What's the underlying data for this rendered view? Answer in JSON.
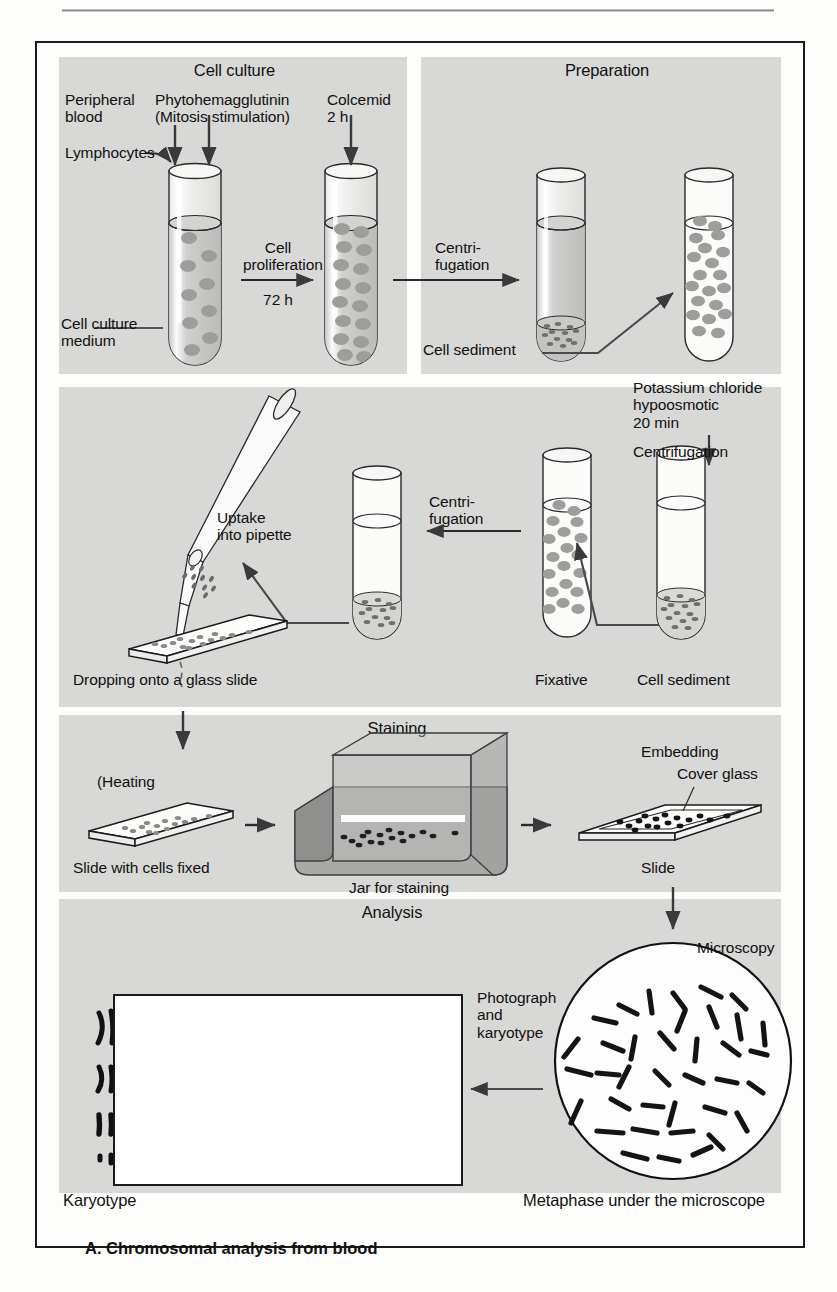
{
  "figure": {
    "caption": "A. Chromosomal analysis from blood",
    "panels": [
      {
        "id": "cell-culture",
        "title": "Cell culture"
      },
      {
        "id": "preparation",
        "title": "Preparation"
      },
      {
        "id": "fixation",
        "title": ""
      },
      {
        "id": "staining",
        "title": "Staining"
      },
      {
        "id": "analysis",
        "title": "Analysis"
      }
    ]
  },
  "cell_culture": {
    "title": "Cell culture",
    "peripheral_blood": "Peripheral\nblood",
    "lymphocytes": "Lymphocytes",
    "pha": "Phytohemagglutinin\n(Mitosis stimulation)",
    "colcemid": "Colcemid\n2 h",
    "medium": "Cell culture\nmedium",
    "arrow_label_top": "Cell\nproliferation",
    "arrow_label_bottom": "72 h"
  },
  "preparation": {
    "title": "Preparation",
    "centrifugation": "Centri-\nfugation",
    "cell_sediment": "Cell sediment",
    "kcl": "Potassium chloride\nhypoosmotic\n20 min",
    "centrifugation2": "Centrifugation"
  },
  "fixation": {
    "uptake": "Uptake\ninto pipette",
    "dropping": "Dropping onto a glass slide",
    "centrifugation": "Centri-\nfugation",
    "fixative": "Fixative",
    "cell_sediment": "Cell sediment"
  },
  "staining": {
    "title": "Staining",
    "heating": "(Heating",
    "slide_fixed": "Slide with cells fixed",
    "jar": "Jar for staining",
    "embedding": "Embedding",
    "cover_glass": "Cover glass",
    "slide": "Slide"
  },
  "analysis": {
    "title": "Analysis",
    "photograph": "Photograph\nand\nkaryotype",
    "microscopy": "Microscopy",
    "karyotype": "Karyotype",
    "metaphase": "Metaphase under the microscope"
  },
  "colors": {
    "band": "#d8d8d6",
    "ink": "#1b1b1b",
    "cell_fill": "#9a9a9a",
    "jar_fill": "#a8a8a6",
    "arrow": "#3a3a3a"
  },
  "karyotype_data": {
    "rows": [
      {
        "pairs": 5,
        "gap_after": 3
      },
      {
        "pairs": 7,
        "gap_after": -1
      },
      {
        "pairs": 6,
        "gap_after": 3
      },
      {
        "pairs": 5,
        "gap_after": 4
      }
    ]
  }
}
